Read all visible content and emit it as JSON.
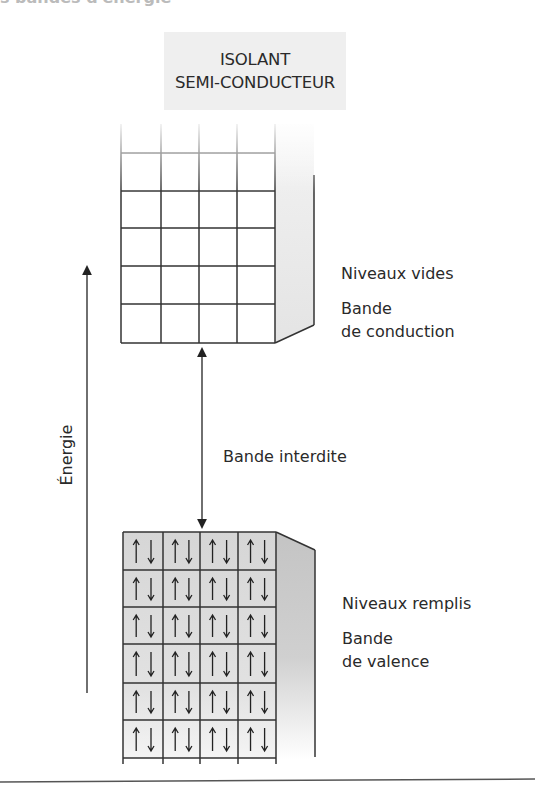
{
  "header": {
    "cut_title": "s bandes d'énergie"
  },
  "title_box": {
    "line1": "ISOLANT",
    "line2": "SEMI-CONDUCTEUR"
  },
  "axis": {
    "label": "Énergie"
  },
  "conduction_band": {
    "levels_label": "Niveaux vides",
    "band_label_line1": "Bande",
    "band_label_line2": "de conduction",
    "rows": 6,
    "columns": 4,
    "fill_color": "#ffffff",
    "side_color": "#e8e8e8"
  },
  "gap": {
    "label": "Bande interdite"
  },
  "valence_band": {
    "levels_label": "Niveaux remplis",
    "band_label_line1": "Bande",
    "band_label_line2": "de valence",
    "rows": 6,
    "columns": 4,
    "cell_symbol": "↑↓",
    "fill_color": "#dcdcdc",
    "side_color": "#c8c8c8"
  }
}
